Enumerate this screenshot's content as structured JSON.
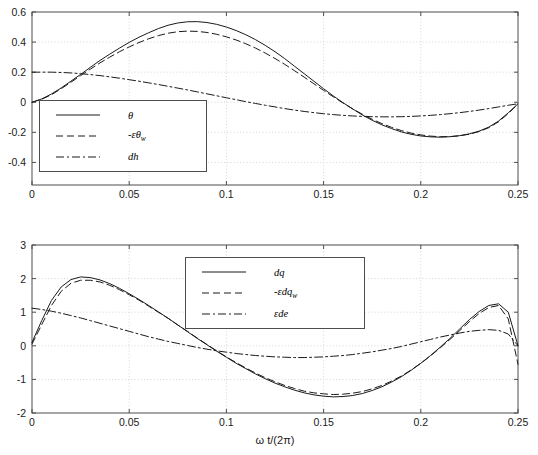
{
  "figure": {
    "background": "#ffffff",
    "axis_color": "#4d4d4d",
    "grid_color": "#cccccc",
    "line_color": "#1a1a1a",
    "xlabel": "ω t/(2π)"
  },
  "chart_data": [
    {
      "type": "line",
      "id": "top-plot",
      "title": "",
      "xlabel": "",
      "ylabel": "",
      "xlim": [
        0,
        0.25
      ],
      "ylim": [
        -0.55,
        0.6
      ],
      "grid": true,
      "legend_position": "lower-left",
      "xticks": [
        0,
        0.05,
        0.1,
        0.15,
        0.2,
        0.25
      ],
      "xticklabels": [
        "0",
        "0.05",
        "0.1",
        "0.15",
        "0.2",
        "0.25"
      ],
      "yticks": [
        -0.4,
        -0.2,
        0,
        0.2,
        0.4,
        0.6
      ],
      "yticklabels": [
        "-0.4",
        "-0.2",
        "0",
        "0.2",
        "0.4",
        "0.6"
      ],
      "x": [
        0,
        0.005,
        0.01,
        0.015,
        0.02,
        0.025,
        0.03,
        0.035,
        0.04,
        0.045,
        0.05,
        0.055,
        0.06,
        0.065,
        0.07,
        0.075,
        0.08,
        0.085,
        0.09,
        0.095,
        0.1,
        0.105,
        0.11,
        0.115,
        0.12,
        0.125,
        0.13,
        0.135,
        0.14,
        0.145,
        0.15,
        0.155,
        0.16,
        0.165,
        0.17,
        0.175,
        0.18,
        0.185,
        0.19,
        0.195,
        0.2,
        0.205,
        0.21,
        0.215,
        0.22,
        0.225,
        0.23,
        0.235,
        0.24,
        0.245,
        0.25
      ],
      "series": [
        {
          "name": "θ",
          "label_html": "θ",
          "style": "solid",
          "values": [
            0.0,
            0.022,
            0.055,
            0.095,
            0.14,
            0.185,
            0.232,
            0.278,
            0.32,
            0.36,
            0.398,
            0.432,
            0.462,
            0.49,
            0.512,
            0.527,
            0.535,
            0.536,
            0.53,
            0.518,
            0.5,
            0.477,
            0.449,
            0.416,
            0.378,
            0.336,
            0.29,
            0.24,
            0.19,
            0.14,
            0.09,
            0.042,
            -0.003,
            -0.045,
            -0.085,
            -0.12,
            -0.15,
            -0.175,
            -0.197,
            -0.213,
            -0.224,
            -0.23,
            -0.232,
            -0.229,
            -0.222,
            -0.21,
            -0.192,
            -0.165,
            -0.125,
            -0.07,
            -0.01
          ]
        },
        {
          "name": "-εθ_w",
          "label_html": "-εθ<sub>w</sub>",
          "style": "dashed",
          "values": [
            0.0,
            0.02,
            0.05,
            0.09,
            0.133,
            0.177,
            0.22,
            0.262,
            0.3,
            0.336,
            0.368,
            0.397,
            0.422,
            0.443,
            0.459,
            0.469,
            0.473,
            0.471,
            0.464,
            0.452,
            0.435,
            0.414,
            0.389,
            0.36,
            0.327,
            0.291,
            0.252,
            0.21,
            0.167,
            0.123,
            0.079,
            0.036,
            -0.005,
            -0.044,
            -0.08,
            -0.113,
            -0.142,
            -0.167,
            -0.188,
            -0.205,
            -0.217,
            -0.225,
            -0.229,
            -0.228,
            -0.223,
            -0.212,
            -0.195,
            -0.169,
            -0.13,
            -0.075,
            -0.012
          ]
        },
        {
          "name": "dh",
          "label_html": "dh",
          "style": "dashdot",
          "values": [
            0.2,
            0.2,
            0.2,
            0.198,
            0.195,
            0.19,
            0.184,
            0.177,
            0.169,
            0.16,
            0.15,
            0.14,
            0.129,
            0.118,
            0.106,
            0.094,
            0.082,
            0.069,
            0.056,
            0.043,
            0.03,
            0.017,
            0.004,
            -0.008,
            -0.02,
            -0.031,
            -0.042,
            -0.052,
            -0.061,
            -0.069,
            -0.076,
            -0.082,
            -0.087,
            -0.091,
            -0.094,
            -0.096,
            -0.097,
            -0.097,
            -0.096,
            -0.094,
            -0.091,
            -0.087,
            -0.082,
            -0.076,
            -0.069,
            -0.061,
            -0.052,
            -0.042,
            -0.031,
            -0.02,
            -0.01
          ]
        }
      ]
    },
    {
      "type": "line",
      "id": "bottom-plot",
      "title": "",
      "xlabel": "ω t/(2π)",
      "ylabel": "",
      "xlim": [
        0,
        0.25
      ],
      "ylim": [
        -2,
        3
      ],
      "grid": true,
      "legend_position": "upper-center",
      "xticks": [
        0,
        0.05,
        0.1,
        0.15,
        0.2,
        0.25
      ],
      "xticklabels": [
        "0",
        "0.05",
        "0.1",
        "0.15",
        "0.2",
        "0.25"
      ],
      "yticks": [
        -2,
        -1,
        0,
        1,
        2,
        3
      ],
      "yticklabels": [
        "-2",
        "-1",
        "0",
        "1",
        "2",
        "3"
      ],
      "x": [
        0,
        0.005,
        0.01,
        0.015,
        0.02,
        0.025,
        0.03,
        0.035,
        0.04,
        0.045,
        0.05,
        0.055,
        0.06,
        0.065,
        0.07,
        0.075,
        0.08,
        0.085,
        0.09,
        0.095,
        0.1,
        0.105,
        0.11,
        0.115,
        0.12,
        0.125,
        0.13,
        0.135,
        0.14,
        0.145,
        0.15,
        0.155,
        0.16,
        0.165,
        0.17,
        0.175,
        0.18,
        0.185,
        0.19,
        0.195,
        0.2,
        0.205,
        0.21,
        0.215,
        0.22,
        0.225,
        0.23,
        0.235,
        0.24,
        0.245,
        0.25
      ],
      "series": [
        {
          "name": "dq",
          "label_html": "dq",
          "style": "solid",
          "values": [
            0.1,
            0.75,
            1.35,
            1.75,
            1.97,
            2.05,
            2.03,
            1.96,
            1.85,
            1.71,
            1.55,
            1.38,
            1.2,
            1.01,
            0.82,
            0.62,
            0.42,
            0.22,
            0.03,
            -0.16,
            -0.34,
            -0.52,
            -0.68,
            -0.84,
            -0.98,
            -1.11,
            -1.22,
            -1.32,
            -1.4,
            -1.46,
            -1.5,
            -1.52,
            -1.51,
            -1.48,
            -1.42,
            -1.33,
            -1.22,
            -1.08,
            -0.92,
            -0.73,
            -0.52,
            -0.29,
            -0.04,
            0.22,
            0.5,
            0.78,
            1.02,
            1.2,
            1.25,
            1.0,
            0.0
          ]
        },
        {
          "name": "-εdq_w",
          "label_html": "-εdq<sub>w</sub>",
          "style": "dashed",
          "values": [
            0.05,
            0.63,
            1.2,
            1.62,
            1.86,
            1.95,
            1.95,
            1.9,
            1.8,
            1.67,
            1.52,
            1.36,
            1.18,
            1.0,
            0.82,
            0.62,
            0.43,
            0.23,
            0.04,
            -0.15,
            -0.33,
            -0.5,
            -0.66,
            -0.81,
            -0.95,
            -1.07,
            -1.18,
            -1.27,
            -1.35,
            -1.4,
            -1.43,
            -1.45,
            -1.44,
            -1.41,
            -1.36,
            -1.28,
            -1.18,
            -1.05,
            -0.9,
            -0.72,
            -0.52,
            -0.3,
            -0.06,
            0.19,
            0.45,
            0.72,
            0.96,
            1.14,
            1.2,
            0.8,
            -0.55
          ]
        },
        {
          "name": "εde",
          "label_html": "εde",
          "style": "dashdot",
          "values": [
            1.12,
            1.08,
            1.03,
            0.97,
            0.9,
            0.83,
            0.75,
            0.67,
            0.59,
            0.51,
            0.43,
            0.35,
            0.27,
            0.2,
            0.13,
            0.07,
            0.01,
            -0.05,
            -0.1,
            -0.15,
            -0.19,
            -0.23,
            -0.26,
            -0.29,
            -0.31,
            -0.33,
            -0.34,
            -0.35,
            -0.35,
            -0.34,
            -0.33,
            -0.31,
            -0.29,
            -0.26,
            -0.22,
            -0.18,
            -0.13,
            -0.08,
            -0.02,
            0.05,
            0.12,
            0.19,
            0.26,
            0.32,
            0.38,
            0.43,
            0.46,
            0.48,
            0.46,
            0.35,
            0.0
          ]
        }
      ]
    }
  ]
}
